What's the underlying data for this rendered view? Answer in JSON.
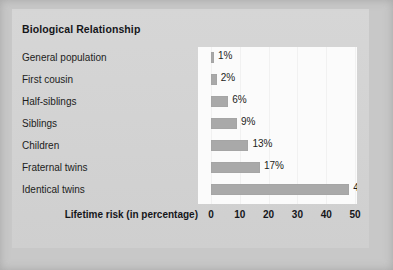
{
  "chart_data": {
    "type": "bar",
    "orientation": "horizontal",
    "title": "Biological Relationship",
    "xlabel": "Lifetime risk (in percentage)",
    "ylabel": "",
    "xlim": [
      0,
      50
    ],
    "xticks": [
      "0",
      "10",
      "20",
      "30",
      "40",
      "50"
    ],
    "grid": true,
    "legend": "none",
    "categories": [
      "General population",
      "First cousin",
      "Half-siblings",
      "Siblings",
      "Children",
      "Fraternal twins",
      "Identical twins"
    ],
    "values": [
      1,
      2,
      6,
      9,
      13,
      17,
      48
    ],
    "value_labels": [
      "1%",
      "2%",
      "6%",
      "9%",
      "13%",
      "17%",
      "48%"
    ],
    "colors": {
      "bar": "#a9a9a9",
      "plot_background": "#fbfbfb",
      "card_background": "#d4d4d4",
      "page_background": "#c8c8c8",
      "text": "#1c1d21",
      "gridline": "#f1f1f1"
    }
  }
}
